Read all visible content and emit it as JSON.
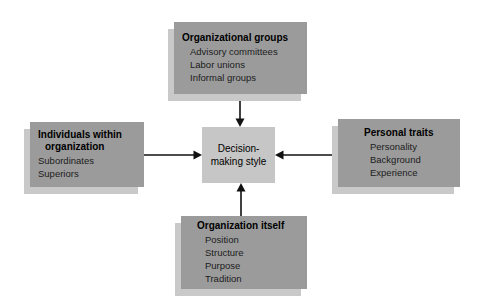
{
  "diagram_title": "Decision-making style influences",
  "center": {
    "line1": "Decision-",
    "line2": "making style"
  },
  "boxes": {
    "top": {
      "title": "Organizational groups",
      "items": [
        "Advisory committees",
        "Labor unions",
        "Informal groups"
      ]
    },
    "left": {
      "title_line1": "Individuals within",
      "title_line2": "organization",
      "items": [
        "Subordinates",
        "Superiors"
      ]
    },
    "right": {
      "title": "Personal traits",
      "items": [
        "Personality",
        "Background",
        "Experience"
      ]
    },
    "bottom": {
      "title": "Organization itself",
      "items": [
        "Position",
        "Structure",
        "Purpose",
        "Tradition"
      ]
    }
  },
  "colors": {
    "box_background": "#9b9b9b",
    "box_shadow": "#c9c9c9",
    "center_background": "#c6c6c6",
    "heading_text": "#000000",
    "item_text": "#1c1c1c",
    "arrow": "#111111",
    "page_background": "#ffffff"
  }
}
